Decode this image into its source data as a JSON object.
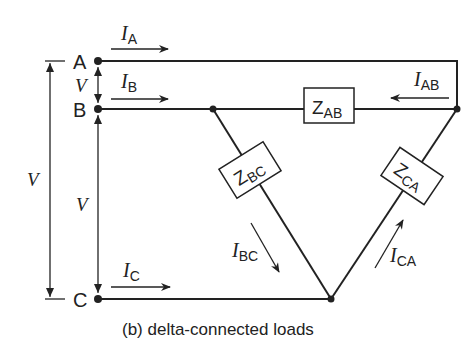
{
  "nodes": {
    "a": "A",
    "b": "B",
    "c": "C"
  },
  "voltage": {
    "ab": "V",
    "bc": "V",
    "ac": "V"
  },
  "currents": {
    "ia": {
      "sym": "I",
      "sub": "A"
    },
    "ib": {
      "sym": "I",
      "sub": "B"
    },
    "ic": {
      "sym": "I",
      "sub": "C"
    },
    "iab": {
      "sym": "I",
      "sub": "AB"
    },
    "ibc": {
      "sym": "I",
      "sub": "BC"
    },
    "ica": {
      "sym": "I",
      "sub": "CA"
    }
  },
  "impedances": {
    "zab": {
      "sym": "Z",
      "sub": "AB"
    },
    "zbc": {
      "sym": "Z",
      "sub": "BC"
    },
    "zca": {
      "sym": "Z",
      "sub": "CA"
    }
  },
  "caption": "(b) delta-connected loads"
}
